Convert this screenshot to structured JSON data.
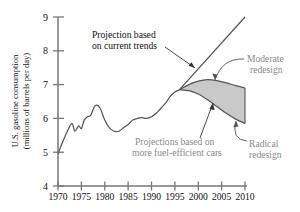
{
  "chart_data": {
    "type": "line",
    "title": "",
    "xlabel": "",
    "ylabel": "U.S. gasoline consumption (millions of barrels per day)",
    "ylabel_line1": "U.S. gasoline consumption",
    "ylabel_line2": "(millions of barrels per day)",
    "xlim": [
      1970,
      2010
    ],
    "ylim": [
      4,
      9
    ],
    "yticks": [
      "4",
      "5",
      "6",
      "7",
      "8",
      "9"
    ],
    "ytick_values": [
      4,
      5,
      6,
      7,
      8,
      9
    ],
    "xticks": [
      "1970",
      "1975",
      "1980",
      "1985",
      "1990",
      "1995",
      "2000",
      "2005",
      "2010"
    ],
    "xtick_values": [
      1970,
      1975,
      1980,
      1985,
      1990,
      1995,
      2000,
      2005,
      2010
    ],
    "grid": false,
    "legend_position": "none",
    "series": [
      {
        "name": "Historical consumption",
        "kind": "line",
        "x": [
          1970,
          1971,
          1972,
          1973,
          1973.6,
          1974.4,
          1975,
          1975.6,
          1976.3,
          1977,
          1978,
          1979,
          1980,
          1981,
          1982,
          1983,
          1984,
          1985,
          1986,
          1987,
          1988,
          1989,
          1990,
          1991,
          1992,
          1993,
          1994,
          1995,
          1996
        ],
        "y": [
          4.95,
          5.3,
          5.62,
          5.85,
          5.62,
          5.78,
          5.7,
          5.95,
          6.05,
          6.1,
          6.38,
          6.3,
          5.95,
          5.72,
          5.62,
          5.62,
          5.72,
          5.82,
          5.95,
          6.0,
          6.02,
          6.0,
          6.05,
          6.15,
          6.3,
          6.45,
          6.65,
          6.78,
          6.85
        ]
      },
      {
        "name": "Projection based on current trends",
        "kind": "line",
        "x": [
          1996,
          2010
        ],
        "y": [
          6.85,
          9.0
        ]
      },
      {
        "name": "Moderate redesign",
        "kind": "line",
        "x": [
          1996,
          1998,
          2000,
          2002,
          2004,
          2006,
          2008,
          2010
        ],
        "y": [
          6.85,
          7.0,
          7.1,
          7.15,
          7.12,
          7.05,
          6.97,
          6.9
        ]
      },
      {
        "name": "Radical redesign",
        "kind": "line",
        "x": [
          1996,
          1998,
          2000,
          2002,
          2004,
          2006,
          2008,
          2010
        ],
        "y": [
          6.85,
          6.82,
          6.72,
          6.55,
          6.35,
          6.15,
          5.98,
          5.85
        ]
      }
    ],
    "shaded_band": {
      "label": "Projections based on more fuel-efficient cars",
      "upper_series": "Moderate redesign",
      "lower_series": "Radical redesign",
      "fill_color": "#c9c9c9"
    },
    "annotations": [
      {
        "name": "projection-current-trends",
        "line1": "Projection based",
        "line2": "on current trends",
        "color": "#111111",
        "points_to": [
          2002,
          7.9
        ]
      },
      {
        "name": "moderate-redesign",
        "line1": "Moderate",
        "line2": "redesign",
        "color": "#8a8a8a",
        "points_to": [
          2003.5,
          7.15
        ]
      },
      {
        "name": "radical-redesign",
        "line1": "Radical",
        "line2": "redesign",
        "color": "#8a8a8a",
        "points_to": [
          2008.5,
          5.95
        ]
      },
      {
        "name": "fuel-efficient-projections",
        "line1": "Projections based on",
        "line2": "more fuel-efficient cars",
        "color": "#8a8a8a",
        "points_to": [
          2005,
          6.45
        ]
      }
    ],
    "colors": {
      "line": "#555555",
      "band_fill": "#c9c9c9",
      "axis": "#777777",
      "axis_text": "#111111",
      "annotation_text": "#8a8a8a"
    }
  }
}
